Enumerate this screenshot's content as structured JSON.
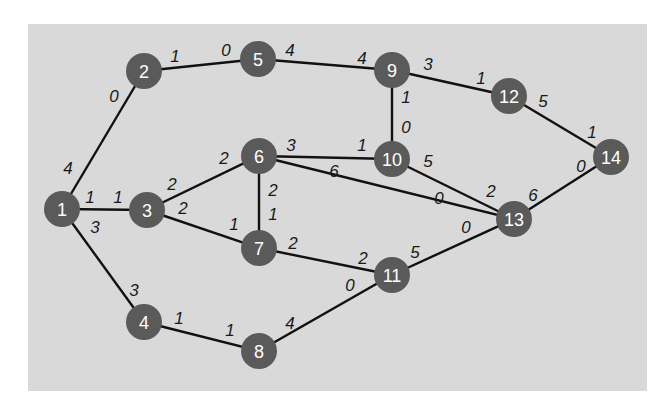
{
  "diagram": {
    "type": "weighted-graph",
    "background_color": "#d9d9d9",
    "node_color": "#5a5a5a",
    "node_text_color": "#ffffff",
    "edge_color": "#111111",
    "node_radius": 18,
    "nodes": [
      {
        "id": "1",
        "label": "1",
        "x": 62,
        "y": 209
      },
      {
        "id": "2",
        "label": "2",
        "x": 144,
        "y": 71
      },
      {
        "id": "3",
        "label": "3",
        "x": 147,
        "y": 210
      },
      {
        "id": "4",
        "label": "4",
        "x": 144,
        "y": 322
      },
      {
        "id": "5",
        "label": "5",
        "x": 258,
        "y": 59
      },
      {
        "id": "6",
        "label": "6",
        "x": 259,
        "y": 156
      },
      {
        "id": "7",
        "label": "7",
        "x": 259,
        "y": 248
      },
      {
        "id": "8",
        "label": "8",
        "x": 259,
        "y": 351
      },
      {
        "id": "9",
        "label": "9",
        "x": 392,
        "y": 70
      },
      {
        "id": "10",
        "label": "10",
        "x": 392,
        "y": 159
      },
      {
        "id": "11",
        "label": "11",
        "x": 392,
        "y": 275
      },
      {
        "id": "12",
        "label": "12",
        "x": 509,
        "y": 96
      },
      {
        "id": "13",
        "label": "13",
        "x": 514,
        "y": 219
      },
      {
        "id": "14",
        "label": "14",
        "x": 611,
        "y": 157
      }
    ],
    "edges": [
      {
        "from": "1",
        "to": "2",
        "label_from": "4",
        "label_to": "0",
        "lf": [
          68,
          168
        ],
        "lt": [
          114,
          96
        ]
      },
      {
        "from": "1",
        "to": "3",
        "label_from": "1",
        "label_to": "1",
        "lf": [
          90,
          197
        ],
        "lt": [
          118,
          197
        ]
      },
      {
        "from": "1",
        "to": "4",
        "label_from": "3",
        "label_to": "3",
        "lf": [
          95,
          227
        ],
        "lt": [
          134,
          290
        ]
      },
      {
        "from": "2",
        "to": "5",
        "label_from": "1",
        "label_to": "0",
        "lf": [
          175,
          56
        ],
        "lt": [
          226,
          50
        ]
      },
      {
        "from": "5",
        "to": "9",
        "label_from": "4",
        "label_to": "4",
        "lf": [
          290,
          50
        ],
        "lt": [
          362,
          58
        ]
      },
      {
        "from": "3",
        "to": "6",
        "label_from": "2",
        "label_to": "2",
        "lf": [
          172,
          184
        ],
        "lt": [
          224,
          158
        ]
      },
      {
        "from": "3",
        "to": "7",
        "label_from": "2",
        "label_to": "1",
        "lf": [
          183,
          208
        ],
        "lt": [
          234,
          224
        ]
      },
      {
        "from": "6",
        "to": "7",
        "label_from": "2",
        "label_to": "1",
        "lf": [
          273,
          190
        ],
        "lt": [
          273,
          214
        ]
      },
      {
        "from": "6",
        "to": "10",
        "label_from": "3",
        "label_to": "1",
        "lf": [
          291,
          145
        ],
        "lt": [
          362,
          145
        ]
      },
      {
        "from": "6",
        "to": "13",
        "label_from": "6",
        "label_to": "0",
        "lf": [
          334,
          171
        ],
        "lt": [
          439,
          198
        ]
      },
      {
        "from": "9",
        "to": "10",
        "label_from": "1",
        "label_to": "0",
        "lf": [
          406,
          97
        ],
        "lt": [
          406,
          127
        ]
      },
      {
        "from": "9",
        "to": "12",
        "label_from": "3",
        "label_to": "1",
        "lf": [
          428,
          64
        ],
        "lt": [
          481,
          78
        ]
      },
      {
        "from": "10",
        "to": "13",
        "label_from": "5",
        "label_to": "2",
        "lf": [
          428,
          161
        ],
        "lt": [
          491,
          191
        ]
      },
      {
        "from": "7",
        "to": "11",
        "label_from": "2",
        "label_to": "2",
        "lf": [
          293,
          243
        ],
        "lt": [
          363,
          258
        ]
      },
      {
        "from": "11",
        "to": "13",
        "label_from": "5",
        "label_to": "0",
        "lf": [
          415,
          252
        ],
        "lt": [
          466,
          227
        ]
      },
      {
        "from": "4",
        "to": "8",
        "label_from": "1",
        "label_to": "1",
        "lf": [
          179,
          318
        ],
        "lt": [
          230,
          330
        ]
      },
      {
        "from": "8",
        "to": "11",
        "label_from": "4",
        "label_to": "0",
        "lf": [
          290,
          323
        ],
        "lt": [
          350,
          285
        ]
      },
      {
        "from": "12",
        "to": "14",
        "label_from": "5",
        "label_to": "1",
        "lf": [
          543,
          101
        ],
        "lt": [
          592,
          132
        ]
      },
      {
        "from": "13",
        "to": "14",
        "label_from": "6",
        "label_to": "0",
        "lf": [
          533,
          195
        ],
        "lt": [
          581,
          166
        ]
      }
    ]
  }
}
